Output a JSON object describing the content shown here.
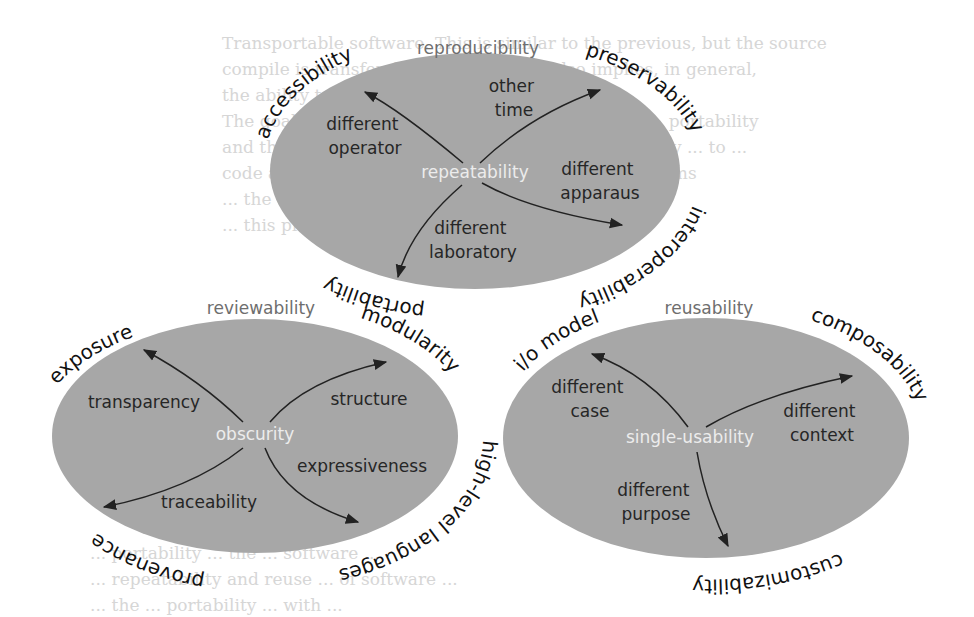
{
  "background_text": {
    "lines": [
      "Transportable software. This is similar to the previous, but the source",
      "compile is transferable. Recomputing also implies, in general,",
      "the ability to execute itself by ...",
      "The goal of the ... to the most important ... is the ... portability",
      "and the whole of research works for the ... the ability ... to ...",
      "code and ... programs ... capable ... across ... platforms",
      "... the cost ... of ... software ... in ...",
      "... this property ... when ... need ..."
    ],
    "lower_lines": [
      "... portability ... the ... software ...",
      "... repeatability and reuse ... of software ...",
      "... the ... portability ... with ..."
    ]
  },
  "diagram": {
    "top": {
      "title": "reproducibility",
      "center": "repeatability",
      "branches": [
        {
          "label_lines": [
            "different",
            "operator"
          ]
        },
        {
          "label_lines": [
            "other",
            "time"
          ]
        },
        {
          "label_lines": [
            "different",
            "apparaus"
          ]
        },
        {
          "label_lines": [
            "different",
            "laboratory"
          ]
        }
      ],
      "arc_labels": {
        "top_left": "accessibility",
        "top_right": "preservability",
        "bottom_right": "interoperability",
        "bottom_left": "portability"
      }
    },
    "bottom_left": {
      "title": "reviewability",
      "center": "obscurity",
      "branches": [
        {
          "label_lines": [
            "transparency"
          ]
        },
        {
          "label_lines": [
            "structure"
          ]
        },
        {
          "label_lines": [
            "expressiveness"
          ]
        },
        {
          "label_lines": [
            "traceability"
          ]
        }
      ],
      "arc_labels": {
        "top_left": "exposure",
        "top_right": "modularity",
        "bottom_right": "high-level languages",
        "bottom_left": "provenance"
      }
    },
    "bottom_right": {
      "title": "reusability",
      "center": "single-usability",
      "branches": [
        {
          "label_lines": [
            "different",
            "case"
          ]
        },
        {
          "label_lines": [
            "different",
            "context"
          ]
        },
        {
          "label_lines": [
            "different",
            "purpose"
          ]
        }
      ],
      "arc_labels": {
        "top_left": "i/o model",
        "top_right": "composability",
        "bottom": "customizability"
      }
    },
    "colors": {
      "ellipse_fill": "#a7a7a7",
      "center_text": "#ececec",
      "branch_text": "#262626",
      "title_text": "#6e6e6e",
      "arc_text": "#111111"
    }
  }
}
